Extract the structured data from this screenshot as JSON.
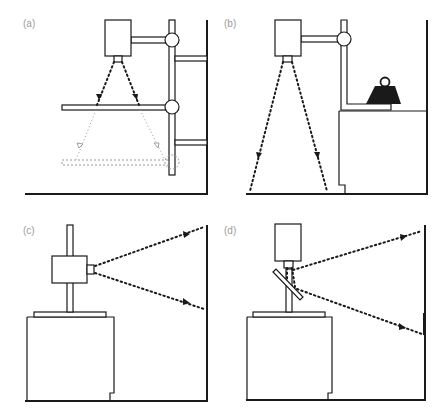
{
  "figure": {
    "panels": [
      {
        "id": "a",
        "label": "(a)",
        "content": "Camera on wall-mounted column with adjustable horizontal baseboard; dotted projection lines to baseboard, light dashed alternate lower baseboard position"
      },
      {
        "id": "b",
        "label": "(b)",
        "content": "Camera on column arm above floor; weight object on bench; projection lines to floor"
      },
      {
        "id": "c",
        "label": "(c)",
        "content": "Camera mounted horizontally on column above bench, projecting onto vertical wall"
      },
      {
        "id": "d",
        "label": "(d)",
        "content": "Vertical camera with 45-degree mirror, projecting horizontally onto vertical wall"
      }
    ]
  },
  "colors": {
    "line": "#1a1a1a",
    "label": "#9a9a9a",
    "alternate_position": "#9a9a9a",
    "background": "#ffffff"
  },
  "icons": {
    "weight": "weight-icon",
    "camera": "camera-icon",
    "mirror": "mirror-icon"
  }
}
